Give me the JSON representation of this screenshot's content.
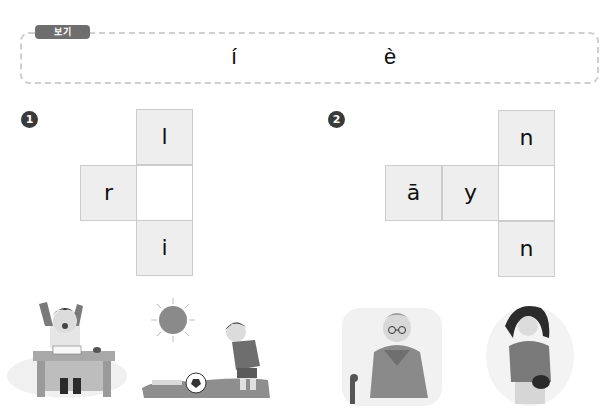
{
  "example": {
    "label": "보기",
    "chars": [
      "í",
      "è"
    ]
  },
  "problems": [
    {
      "number": "1",
      "cells": {
        "top": "l",
        "left": "r",
        "center": "",
        "bottom": "i"
      }
    },
    {
      "number": "2",
      "cells": {
        "top": "n",
        "left1": "ā",
        "left2": "y",
        "center": "",
        "bottom": "n"
      }
    }
  ],
  "pictures": [
    {
      "name": "boy-waking-at-desk",
      "desc": "Boy stretching at desk with open book"
    },
    {
      "name": "boy-with-soccer-ball",
      "desc": "Boy in sun with soccer ball"
    },
    {
      "name": "old-man-with-cane",
      "desc": "Elderly man with glasses and cane"
    },
    {
      "name": "woman-with-bag",
      "desc": "Woman holding a handbag"
    }
  ]
}
